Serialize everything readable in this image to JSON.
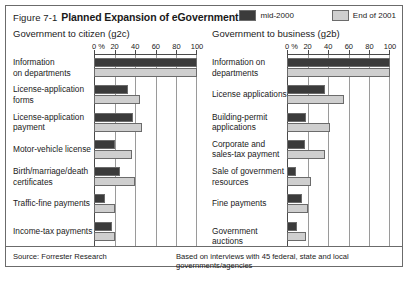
{
  "figure": {
    "number": "Figure 7-1",
    "title": "Planned Expansion of eGovernment"
  },
  "legend": {
    "position": "top-right",
    "items": [
      {
        "label": "mid-2000",
        "color": "#3b3b3b",
        "name": "mid-2000"
      },
      {
        "label": "End of 2001",
        "color": "#cfcfcf",
        "name": "end-of-2001"
      }
    ]
  },
  "footer": {
    "source": "Source: Forrester Research",
    "note": "Based on interviews with 45 federal, state and local governments/agencies"
  },
  "chart_data": [
    {
      "type": "bar",
      "orientation": "horizontal",
      "title": "Government to citizen (g2c)",
      "xlabel": "0 %",
      "ylabel": "",
      "xlim": [
        0,
        100
      ],
      "ticks": [
        0,
        20,
        40,
        60,
        80,
        100
      ],
      "tick_labels": [
        "0 %",
        "20",
        "40",
        "60",
        "80",
        "100"
      ],
      "grid": true,
      "legend_position": "top-right",
      "categories": [
        "Information\non departments",
        "License-application\nforms",
        "License-application\npayment",
        "Motor-vehicle license",
        "Birth/marriage/death\ncertificates",
        "Traffic-fine payments",
        "Income-tax payments"
      ],
      "series": [
        {
          "name": "mid-2000",
          "color": "#3b3b3b",
          "values": [
            100,
            33,
            38,
            20,
            25,
            11,
            17
          ]
        },
        {
          "name": "End of 2001",
          "color": "#cfcfcf",
          "values": [
            100,
            45,
            47,
            37,
            40,
            20,
            20
          ]
        }
      ]
    },
    {
      "type": "bar",
      "orientation": "horizontal",
      "title": "Government to business (g2b)",
      "xlabel": "0 %",
      "ylabel": "",
      "xlim": [
        0,
        100
      ],
      "ticks": [
        0,
        20,
        40,
        60,
        80,
        100
      ],
      "tick_labels": [
        "0 %",
        "20",
        "40",
        "60",
        "80",
        "100"
      ],
      "grid": true,
      "legend_position": "top-right",
      "categories": [
        "Information on\ndepartments",
        "License applications",
        "Building-permit\napplications",
        "Corporate and\nsales-tax payment",
        "Sale of government\nresources",
        "Fine payments",
        "Government auctions"
      ],
      "series": [
        {
          "name": "mid-2000",
          "color": "#3b3b3b",
          "values": [
            100,
            37,
            18,
            17,
            9,
            15,
            10
          ]
        },
        {
          "name": "End of 2001",
          "color": "#cfcfcf",
          "values": [
            100,
            55,
            42,
            37,
            23,
            20,
            18
          ]
        }
      ]
    }
  ]
}
